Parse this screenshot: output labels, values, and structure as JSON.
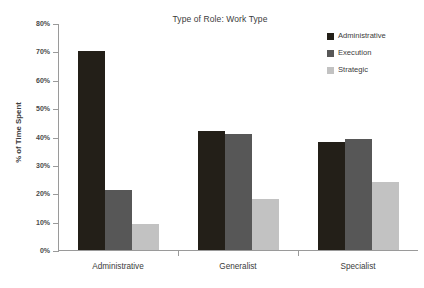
{
  "chart_data": {
    "type": "bar",
    "title": "Type of Role: Work Type",
    "xlabel": "",
    "ylabel": "% of Time Spent",
    "categories": [
      "Administrative",
      "Generalist",
      "Specialist"
    ],
    "series": [
      {
        "name": "Administrative",
        "color": "#231f18",
        "values": [
          70,
          42,
          38
        ]
      },
      {
        "name": "Execution",
        "color": "#575757",
        "values": [
          21,
          41,
          39
        ]
      },
      {
        "name": "Strategic",
        "color": "#c2c2c2",
        "values": [
          9,
          18,
          24
        ]
      }
    ],
    "ylim": [
      0,
      80
    ],
    "ytick_values": [
      0,
      10,
      20,
      30,
      40,
      50,
      60,
      70,
      80
    ],
    "ytick_labels": [
      "0%",
      "10%",
      "20%",
      "30%",
      "40%",
      "50%",
      "60%",
      "70%",
      "80%"
    ],
    "grid": false,
    "legend_position": "top-right",
    "value_format": "percent"
  },
  "legend": {
    "entries": [
      {
        "label": "Administrative",
        "swatch_name": "legend-swatch-administrative"
      },
      {
        "label": "Execution",
        "swatch_name": "legend-swatch-execution"
      },
      {
        "label": "Strategic",
        "swatch_name": "legend-swatch-strategic"
      }
    ]
  }
}
